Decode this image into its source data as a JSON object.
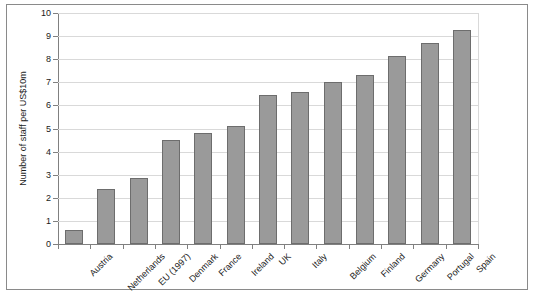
{
  "chart_data": {
    "type": "bar",
    "title": "",
    "xlabel": "",
    "ylabel": "Number of staff per US$10m",
    "ylim": [
      0,
      10
    ],
    "ytick_step": 1,
    "grid": true,
    "legend": false,
    "bar_color": "#9a9a9a",
    "bar_edge_color": "#6d6d6d",
    "grid_color": "#d9d9d9",
    "axis_color": "#808080",
    "xtick_rotation": -45,
    "categories": [
      "Austria",
      "Netherlands",
      "EU (1997)",
      "Denmark",
      "France",
      "Ireland",
      "UK",
      "Italy",
      "Belgium",
      "Finland",
      "Germany",
      "Portugal",
      "Spain"
    ],
    "values": [
      0.6,
      2.4,
      2.85,
      4.5,
      4.8,
      5.1,
      6.45,
      6.6,
      7.0,
      7.3,
      8.15,
      8.7,
      9.25
    ],
    "yticks": [
      "0",
      "1",
      "2",
      "3",
      "4",
      "5",
      "6",
      "7",
      "8",
      "9",
      "10"
    ]
  }
}
